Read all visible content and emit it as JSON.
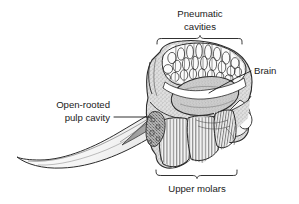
{
  "figure": {
    "background_color": "#ffffff",
    "ink_color": "#1a1a1a",
    "width": 299,
    "height": 204
  },
  "labels": {
    "pneumatic_cavities": {
      "line1": "Pneumatic",
      "line2": "cavities",
      "position": "top-center",
      "connector": "brace-below"
    },
    "brain": {
      "text": "Brain",
      "position": "right",
      "connector": "leader-line"
    },
    "open_rooted_pulp_cavity": {
      "line1": "Open-rooted",
      "line2": "pulp cavity",
      "position": "left",
      "connector": "leader-line"
    },
    "upper_molars": {
      "text": "Upper molars",
      "position": "bottom-center",
      "connector": "brace-above"
    }
  },
  "anatomy": {
    "regions": [
      {
        "name": "pneumatic-cavities",
        "description": "honeycomb air cells in cranial roof",
        "fill": "#ffffff"
      },
      {
        "name": "brain-cavity",
        "description": "large stippled oval braincase",
        "fill": "#c9c9c9"
      },
      {
        "name": "upper-molars",
        "description": "vertically ridged grinding teeth",
        "fill": "#efefef"
      },
      {
        "name": "tusk",
        "description": "long curved incisor sweeping down and left",
        "fill": "#ffffff"
      },
      {
        "name": "pulp-cavity",
        "description": "shaded open root inside tusk base",
        "fill": "#9b9b9b"
      },
      {
        "name": "cranium-bone",
        "description": "stippled spongy bone matrix",
        "fill": "#d6d6d6"
      }
    ]
  },
  "colors": {
    "ink": "#1a1a1a",
    "outline": "#2b2b2b",
    "brain_fill": "#c9c9c9",
    "pulp_fill": "#9b9b9b",
    "bone_fill": "#d8d8d8",
    "molar_fill": "#f0f0f0",
    "background": "#ffffff"
  }
}
